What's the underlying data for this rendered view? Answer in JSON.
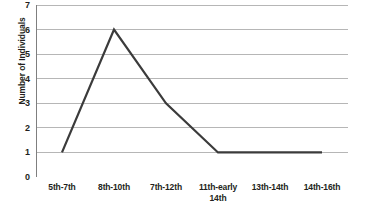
{
  "chart_data": {
    "type": "line",
    "title": "",
    "subtitle": "",
    "xlabel": "",
    "ylabel": "Number of Individuals",
    "categories": [
      "5th-7th",
      "8th-10th",
      "7th-12th",
      "11th-early 14th",
      "13th-14th",
      "14th-16th"
    ],
    "category_lines": [
      [
        "5th-7th",
        ""
      ],
      [
        "8th-10th",
        ""
      ],
      [
        "7th-12th",
        ""
      ],
      [
        "11th-early",
        "14th"
      ],
      [
        "13th-14th",
        ""
      ],
      [
        "14th-16th",
        ""
      ]
    ],
    "values": [
      1,
      6,
      3,
      1,
      1,
      1
    ],
    "series": [
      {
        "name": "Number of Individuals",
        "values": [
          1,
          6,
          3,
          1,
          1,
          1
        ]
      }
    ],
    "ylim": [
      0,
      7
    ],
    "y_ticks": [
      0,
      1,
      2,
      3,
      4,
      5,
      6,
      7
    ],
    "y_tick_labels": [
      "0",
      "1",
      "2",
      "3",
      "4",
      "5",
      "6",
      "7"
    ],
    "grid": "horizontal",
    "legend": "none",
    "colors": {
      "line": "#3b3b3b",
      "grid": "#b6b6b6",
      "axis": "#7f7f7f",
      "text": "#231f20",
      "background": "#ffffff"
    },
    "line_width": 2.2
  }
}
